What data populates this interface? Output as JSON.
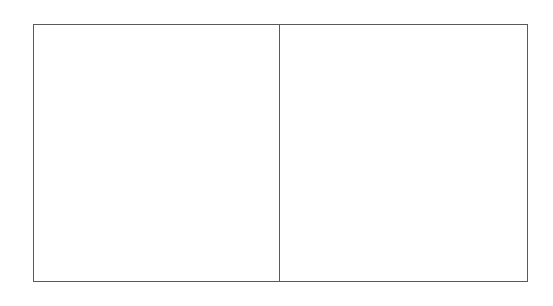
{
  "diagram": {
    "frame": {
      "stroke_color": "#5a5a5a",
      "background": "#ffffff"
    },
    "panels": [
      {
        "id": "left",
        "label": ""
      },
      {
        "id": "right",
        "label": ""
      }
    ]
  }
}
